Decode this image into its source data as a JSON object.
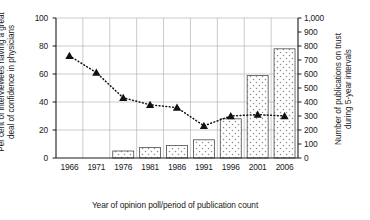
{
  "chart_data": {
    "type": "bar",
    "title": "",
    "xlabel": "Year of opinion poll/period of publication count",
    "categories": [
      "1966",
      "1971",
      "1976",
      "1981",
      "1986",
      "1991",
      "1996",
      "2001",
      "2006"
    ],
    "grid": true,
    "legend": "none",
    "axes": {
      "left": {
        "label_lines": [
          "Per cent of interviewees having a great",
          "deal of confidence in physicians"
        ],
        "label": "Per cent of interviewees having a great deal of confidence in physicians",
        "ticks": [
          "0",
          "20",
          "40",
          "60",
          "80",
          "100"
        ],
        "tick_values": [
          0,
          20,
          40,
          60,
          80,
          100
        ],
        "ylim": [
          0,
          100
        ]
      },
      "right": {
        "label_lines": [
          "Number of publications on trust",
          "during 5-year intervals"
        ],
        "label": "Number of publications on trust during 5-year intervals",
        "ticks": [
          "0",
          "100",
          "200",
          "300",
          "400",
          "500",
          "600",
          "700",
          "800",
          "900",
          "1,000"
        ],
        "tick_values": [
          0,
          100,
          200,
          300,
          400,
          500,
          600,
          700,
          800,
          900,
          1000
        ],
        "ylim": [
          0,
          1000
        ]
      }
    },
    "series": [
      {
        "name": "Number of publications on trust during 5-year intervals",
        "type": "bar",
        "axis": "right",
        "fill": "dotted-pattern",
        "values": [
          null,
          null,
          50,
          75,
          90,
          130,
          280,
          590,
          780
        ]
      },
      {
        "name": "Per cent of interviewees having a great deal of confidence in physicians",
        "type": "line",
        "axis": "left",
        "marker": "triangle",
        "linestyle": "dotted",
        "values": [
          73,
          61,
          43,
          38,
          36,
          23,
          30,
          31,
          30
        ]
      }
    ],
    "colors": {
      "axis": "#1a1a1a",
      "grid": "#b4b4b4",
      "bar_edge": "#4d4d4d",
      "bar_fill": "#ffffff",
      "bar_dots": "#7a7a7a",
      "marker": "#111111",
      "line": "#111111",
      "background": "#ffffff"
    }
  }
}
